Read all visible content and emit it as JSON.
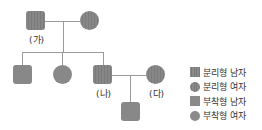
{
  "pedigree": {
    "generation1": {
      "father": {
        "sex": "male",
        "type": "분리형",
        "label": "(가)"
      },
      "mother": {
        "sex": "female",
        "type": "분리형",
        "label": ""
      }
    },
    "generation2": [
      {
        "sex": "male",
        "type": "부착형",
        "label": ""
      },
      {
        "sex": "female",
        "type": "부착형",
        "label": ""
      },
      {
        "sex": "male",
        "type": "분리형",
        "label": "(나)"
      }
    ],
    "spouse": {
      "sex": "female",
      "type": "분리형",
      "label": "(다)"
    },
    "generation3": [
      {
        "sex": "male",
        "type": "부착형",
        "label": ""
      }
    ]
  },
  "labels": {
    "ga": "(가)",
    "na": "(나)",
    "da": "(다)"
  },
  "legend": [
    {
      "shape": "square",
      "pattern": "striped",
      "text": "분리형 남자"
    },
    {
      "shape": "circle",
      "pattern": "striped",
      "text": "분리형 여자"
    },
    {
      "shape": "square",
      "pattern": "solid",
      "text": "부착형 남자"
    },
    {
      "shape": "circle",
      "pattern": "solid",
      "text": "부착형 여자"
    }
  ],
  "colors": {
    "fill": "#888888",
    "line": "#9a9a9a",
    "text": "#333333"
  }
}
